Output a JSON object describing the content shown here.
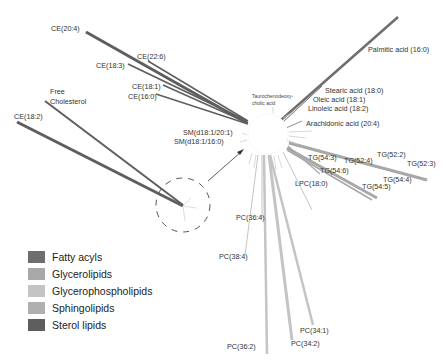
{
  "colors": {
    "fatty_acyls": "#6e6e6e",
    "glycerolipids": "#a8a8a8",
    "glycerophospholipids": "#c4c4c4",
    "sphingolipids": "#b0b0b0",
    "sterol_lipids": "#5e5e5e"
  },
  "center_label": "Taurochenodeoxy-\ncholic acid",
  "center_label_lines": [
    "Taurochenodeoxy-",
    "cholic acid"
  ],
  "labels": {
    "ce_20_4": "CE(20:4)",
    "ce_22_6": "CE(22:6)",
    "ce_18_3": "CE(18:3)",
    "ce_18_1": "CE(18:1)",
    "ce_16_0": "CE(16:0)",
    "free_chol_1": "Free",
    "free_chol_2": "Cholesterol",
    "ce_18_2": "CE(18:2)",
    "sm_20_1": "SM(d18:1/20:1)",
    "sm_16_0": "SM(d18:1/16:0)",
    "palmitic": "Palmitic acid (16:0)",
    "stearic": "Stearic acid (18:0)",
    "oleic": "Oleic acid (18:1)",
    "linoleic": "Linoleic acid (18:2)",
    "arachidonic": "Arachidonic acid (20:4)",
    "tg_54_3": "TG(54:3)",
    "tg_52_4": "TG(52:4)",
    "tg_52_2": "TG(52:2)",
    "tg_52_3": "TG(52:3)",
    "tg_54_6": "TG(54:6)",
    "tg_54_4": "TG(54:4)",
    "tg_54_5": "TG(54:5)",
    "lpc_18_0": "LPC(18:0)",
    "pc_36_4": "PC(36:4)",
    "pc_38_4": "PC(38:4)",
    "pc_34_1": "PC(34:1)",
    "pc_36_2": "PC(36:2)",
    "pc_34_2": "PC(34:2)"
  },
  "legend": [
    {
      "label": "Fatty acyls",
      "color": "#6e6e6e"
    },
    {
      "label": "Glycerolipids",
      "color": "#a8a8a8"
    },
    {
      "label": "Glycerophospholipids",
      "color": "#c4c4c4"
    },
    {
      "label": "Sphingolipids",
      "color": "#b0b0b0"
    },
    {
      "label": "Sterol lipids",
      "color": "#5e5e5e"
    }
  ]
}
